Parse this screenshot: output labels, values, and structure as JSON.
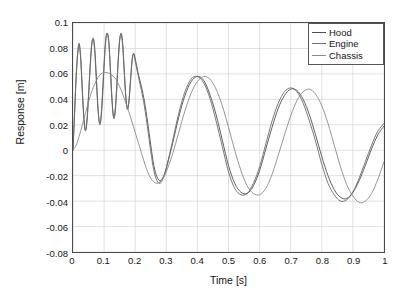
{
  "chart_data": {
    "type": "line",
    "title": "",
    "xlabel": "Time [s]",
    "ylabel": "Response [m]",
    "xlim": [
      0,
      1
    ],
    "ylim": [
      -0.08,
      0.1
    ],
    "xticks": [
      "0",
      "0.1",
      "0.2",
      "0.3",
      "0.4",
      "0.5",
      "0.6",
      "0.7",
      "0.8",
      "0.9",
      "1"
    ],
    "xtick_values": [
      0,
      0.1,
      0.2,
      0.3,
      0.4,
      0.5,
      0.6,
      0.7,
      0.8,
      0.9,
      1
    ],
    "yticks": [
      "0.1",
      "0.08",
      "0.06",
      "0.04",
      "0.02",
      "0",
      "-0.02",
      "-0.04",
      "-0.06",
      "-0.08"
    ],
    "ytick_values": [
      0.1,
      0.08,
      0.06,
      0.04,
      0.02,
      0,
      -0.02,
      -0.04,
      -0.06,
      -0.08
    ],
    "grid": true,
    "legend_position": "top-right",
    "series": [
      {
        "name": "Hood",
        "color": "#4d4d4d",
        "x": [
          0,
          0.005,
          0.01,
          0.015,
          0.02,
          0.025,
          0.03,
          0.035,
          0.04,
          0.045,
          0.05,
          0.055,
          0.06,
          0.065,
          0.07,
          0.075,
          0.08,
          0.085,
          0.09,
          0.095,
          0.1,
          0.105,
          0.11,
          0.115,
          0.12,
          0.125,
          0.13,
          0.135,
          0.14,
          0.145,
          0.15,
          0.155,
          0.16,
          0.165,
          0.17,
          0.175,
          0.18,
          0.185,
          0.19,
          0.195,
          0.2,
          0.21,
          0.22,
          0.23,
          0.24,
          0.25,
          0.26,
          0.27,
          0.28,
          0.29,
          0.3,
          0.32,
          0.34,
          0.36,
          0.38,
          0.4,
          0.42,
          0.44,
          0.46,
          0.48,
          0.5,
          0.52,
          0.54,
          0.56,
          0.58,
          0.6,
          0.62,
          0.64,
          0.66,
          0.68,
          0.7,
          0.72,
          0.74,
          0.76,
          0.78,
          0.8,
          0.82,
          0.84,
          0.86,
          0.88,
          0.9,
          0.92,
          0.94,
          0.96,
          0.98,
          1
        ],
        "y": [
          0,
          0.028,
          0.056,
          0.075,
          0.083,
          0.072,
          0.048,
          0.026,
          0.016,
          0.023,
          0.042,
          0.064,
          0.082,
          0.088,
          0.08,
          0.058,
          0.035,
          0.021,
          0.024,
          0.042,
          0.066,
          0.085,
          0.092,
          0.086,
          0.066,
          0.042,
          0.026,
          0.028,
          0.045,
          0.068,
          0.086,
          0.092,
          0.083,
          0.062,
          0.042,
          0.032,
          0.038,
          0.054,
          0.07,
          0.076,
          0.072,
          0.06,
          0.05,
          0.038,
          0.022,
          0.004,
          -0.012,
          -0.021,
          -0.024,
          -0.021,
          -0.014,
          0.005,
          0.026,
          0.043,
          0.054,
          0.058,
          0.055,
          0.044,
          0.028,
          0.008,
          -0.012,
          -0.026,
          -0.033,
          -0.034,
          -0.028,
          -0.016,
          0.001,
          0.018,
          0.033,
          0.043,
          0.048,
          0.047,
          0.04,
          0.028,
          0.012,
          -0.005,
          -0.02,
          -0.031,
          -0.037,
          -0.038,
          -0.033,
          -0.024,
          -0.012,
          0.001,
          0.012,
          0.019
        ]
      },
      {
        "name": "Engine",
        "color": "#6b6b6b",
        "x": [
          0,
          0.005,
          0.01,
          0.015,
          0.02,
          0.025,
          0.03,
          0.035,
          0.04,
          0.045,
          0.05,
          0.055,
          0.06,
          0.065,
          0.07,
          0.075,
          0.08,
          0.085,
          0.09,
          0.095,
          0.1,
          0.105,
          0.11,
          0.115,
          0.12,
          0.125,
          0.13,
          0.135,
          0.14,
          0.145,
          0.15,
          0.155,
          0.16,
          0.165,
          0.17,
          0.175,
          0.18,
          0.185,
          0.19,
          0.195,
          0.2,
          0.21,
          0.22,
          0.23,
          0.24,
          0.25,
          0.26,
          0.27,
          0.28,
          0.29,
          0.3,
          0.32,
          0.34,
          0.36,
          0.38,
          0.4,
          0.42,
          0.44,
          0.46,
          0.48,
          0.5,
          0.52,
          0.54,
          0.56,
          0.58,
          0.6,
          0.62,
          0.64,
          0.66,
          0.68,
          0.7,
          0.72,
          0.74,
          0.76,
          0.78,
          0.8,
          0.82,
          0.84,
          0.86,
          0.88,
          0.9,
          0.92,
          0.94,
          0.96,
          0.98,
          1
        ],
        "y": [
          0,
          0.03,
          0.058,
          0.077,
          0.084,
          0.07,
          0.046,
          0.024,
          0.015,
          0.024,
          0.044,
          0.066,
          0.083,
          0.087,
          0.077,
          0.055,
          0.033,
          0.022,
          0.027,
          0.046,
          0.069,
          0.087,
          0.092,
          0.084,
          0.063,
          0.04,
          0.027,
          0.031,
          0.048,
          0.07,
          0.087,
          0.091,
          0.081,
          0.06,
          0.041,
          0.033,
          0.04,
          0.056,
          0.071,
          0.076,
          0.07,
          0.058,
          0.047,
          0.034,
          0.017,
          -0.001,
          -0.016,
          -0.024,
          -0.026,
          -0.022,
          -0.014,
          0.007,
          0.029,
          0.046,
          0.056,
          0.058,
          0.053,
          0.041,
          0.023,
          0.003,
          -0.017,
          -0.03,
          -0.035,
          -0.034,
          -0.026,
          -0.013,
          0.005,
          0.023,
          0.037,
          0.046,
          0.049,
          0.046,
          0.037,
          0.023,
          0.007,
          -0.011,
          -0.026,
          -0.035,
          -0.04,
          -0.039,
          -0.033,
          -0.022,
          -0.009,
          0.004,
          0.015,
          0.021
        ]
      },
      {
        "name": "Chassis",
        "color": "#8a8a8a",
        "x": [
          0,
          0.01,
          0.02,
          0.03,
          0.04,
          0.05,
          0.06,
          0.07,
          0.08,
          0.09,
          0.1,
          0.11,
          0.12,
          0.13,
          0.14,
          0.15,
          0.16,
          0.17,
          0.18,
          0.19,
          0.2,
          0.21,
          0.22,
          0.23,
          0.24,
          0.25,
          0.26,
          0.27,
          0.28,
          0.29,
          0.3,
          0.32,
          0.34,
          0.36,
          0.38,
          0.4,
          0.42,
          0.44,
          0.46,
          0.48,
          0.5,
          0.52,
          0.54,
          0.56,
          0.58,
          0.6,
          0.62,
          0.64,
          0.66,
          0.68,
          0.7,
          0.72,
          0.74,
          0.76,
          0.78,
          0.8,
          0.82,
          0.84,
          0.86,
          0.88,
          0.9,
          0.92,
          0.94,
          0.96,
          0.98,
          1
        ],
        "y": [
          0,
          0.004,
          0.011,
          0.02,
          0.029,
          0.038,
          0.046,
          0.052,
          0.057,
          0.06,
          0.061,
          0.061,
          0.06,
          0.058,
          0.055,
          0.05,
          0.044,
          0.037,
          0.03,
          0.022,
          0.014,
          0.006,
          -0.002,
          -0.01,
          -0.017,
          -0.022,
          -0.025,
          -0.026,
          -0.025,
          -0.022,
          -0.017,
          -0.003,
          0.014,
          0.031,
          0.045,
          0.054,
          0.058,
          0.056,
          0.048,
          0.035,
          0.018,
          0,
          -0.016,
          -0.028,
          -0.034,
          -0.035,
          -0.03,
          -0.019,
          -0.004,
          0.012,
          0.027,
          0.039,
          0.046,
          0.048,
          0.044,
          0.035,
          0.021,
          0.004,
          -0.013,
          -0.027,
          -0.036,
          -0.041,
          -0.04,
          -0.034,
          -0.023,
          -0.009
        ]
      }
    ]
  },
  "legend": {
    "items": [
      {
        "label": "Hood"
      },
      {
        "label": "Engine"
      },
      {
        "label": "Chassis"
      }
    ]
  },
  "colors": {
    "axis": "#4a4a4a",
    "grid": "#cccccc",
    "background": "#ffffff",
    "text": "#141414"
  }
}
